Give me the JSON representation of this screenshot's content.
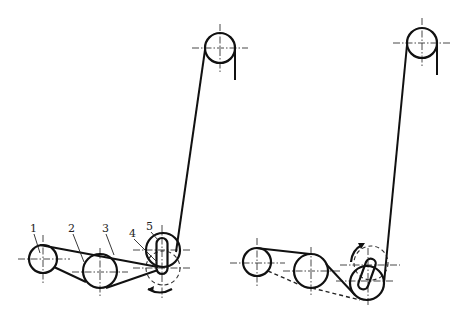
{
  "figure": {
    "colors": {
      "ink": "#111111",
      "background": "#ffffff"
    },
    "left_diagram": {
      "labels": [
        {
          "id": "1",
          "text": "1"
        },
        {
          "id": "2",
          "text": "2"
        },
        {
          "id": "3",
          "text": "3"
        },
        {
          "id": "4",
          "text": "4"
        },
        {
          "id": "5",
          "text": "5"
        }
      ]
    },
    "right_diagram": {
      "labels": []
    }
  }
}
